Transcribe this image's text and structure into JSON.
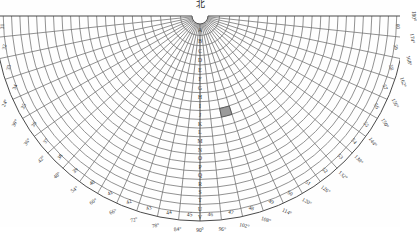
{
  "title": "北",
  "colors": {
    "grid": "#4a4a4a",
    "grid_light": "#6e6e6e",
    "text": "#2f2f2f",
    "highlight": "#9a9a9a",
    "background": "#fefefe"
  },
  "chart_data": {
    "type": "polar-sector-grid",
    "title": "北",
    "xlabel": "",
    "ylabel": "",
    "apex": {
      "x": 200,
      "y": 16
    },
    "sector": {
      "start_deg": 0,
      "end_deg": 180,
      "sweep_deg": 180
    },
    "radial_range": {
      "inner": 8,
      "outer": 205
    },
    "ring_count": 22,
    "ring_labels": [
      "A",
      "B",
      "C",
      "D",
      "E",
      "F",
      "G",
      "H",
      "I",
      "J",
      "K",
      "L",
      "M",
      "N",
      "O",
      "P",
      "Q",
      "R",
      "S",
      "T",
      "U",
      "V"
    ],
    "ring_label_note": "A is innermost arc nearest the bottom of the centre column; V is outermost nearest the apex",
    "degree_ticks": [
      "0°",
      "6°",
      "12°",
      "18°",
      "24°",
      "30°",
      "36°",
      "42°",
      "48°",
      "54°",
      "60°",
      "66°",
      "72°",
      "78°",
      "84°",
      "90°",
      "96°",
      "102°",
      "108°",
      "114°",
      "120°",
      "126°",
      "132°",
      "138°",
      "144°",
      "150°",
      "156°",
      "162°",
      "168°",
      "174°",
      "180°"
    ],
    "degree_tick_step": 6,
    "rim_numbers": [
      31,
      32,
      33,
      34,
      35,
      36,
      37,
      38,
      39,
      40,
      41,
      42,
      43,
      44,
      45,
      46,
      47,
      48,
      49,
      50,
      51,
      52,
      53,
      54,
      55,
      56,
      57,
      58,
      59,
      60
    ],
    "rim_number_note": "Sector column numbers running left-to-right along the outer arc, 31 at 0° through 60 at 180°",
    "centre_column_label": "A",
    "centre_column_degree": "90°",
    "highlight_cell": {
      "column": 48,
      "ring": "J",
      "fill": "#9a9a9a"
    },
    "grid": true,
    "legend": "none"
  },
  "annotations": {
    "highlight_description": "single shaded grid cell right of centre"
  }
}
